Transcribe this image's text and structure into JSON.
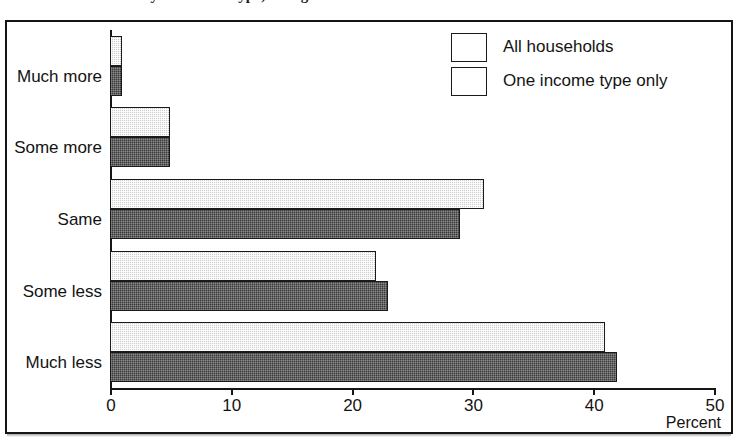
{
  "page": {
    "cut_off_title": "Households: Income by household type, change"
  },
  "chart_data": {
    "type": "bar",
    "orientation": "horizontal",
    "title": "",
    "xlabel": "Percent",
    "ylabel": "",
    "xlim": [
      0,
      50
    ],
    "xticks": [
      0,
      10,
      20,
      30,
      40,
      50
    ],
    "xtick_labels": [
      "0",
      "10",
      "20",
      "30",
      "40",
      "50"
    ],
    "grid": false,
    "legend_position": "top-right",
    "categories": [
      "Much more",
      "Some more",
      "Same",
      "Some less",
      "Much less"
    ],
    "series": [
      {
        "name": "All households",
        "color": "#cdcdcd",
        "values": [
          1,
          5,
          31,
          22,
          41
        ]
      },
      {
        "name": "One income type only",
        "color": "#3a3a3a",
        "values": [
          1,
          5,
          29,
          23,
          42
        ]
      }
    ]
  },
  "legend": {
    "items": [
      {
        "label": "All households",
        "swatch": "light-gray-swatch"
      },
      {
        "label": "One income type only",
        "swatch": "dark-gray-swatch"
      }
    ]
  }
}
